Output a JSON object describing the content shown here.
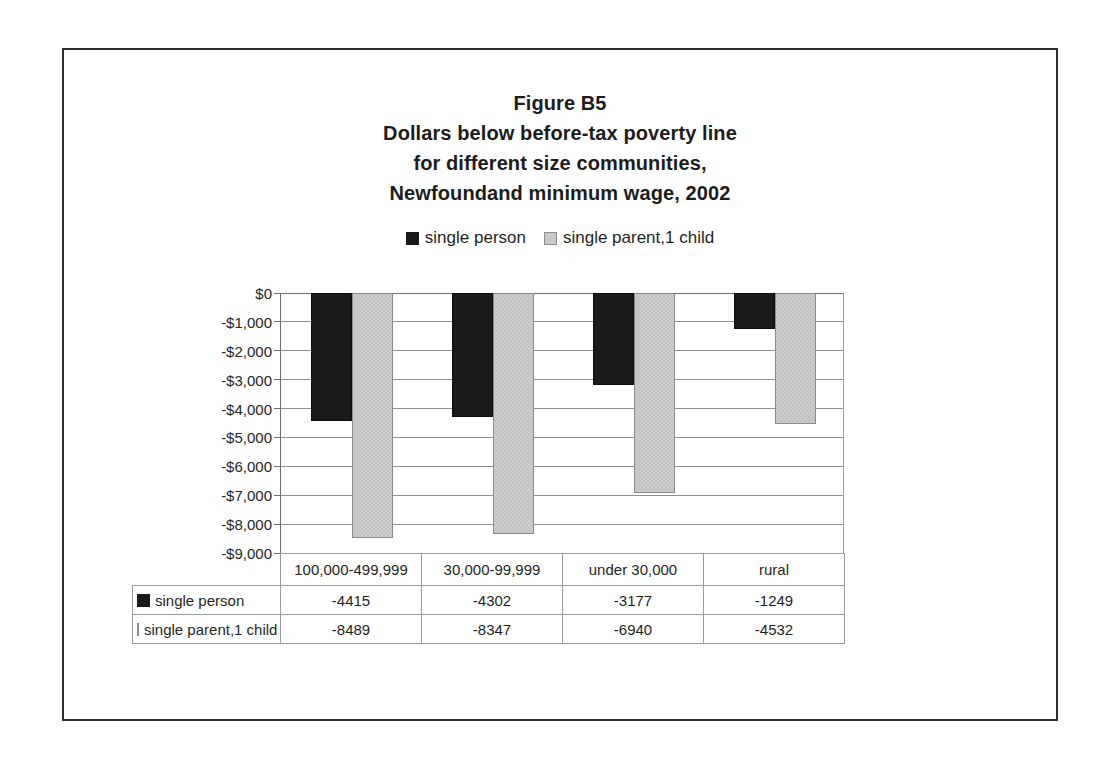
{
  "figure": {
    "title_lines": [
      "Figure B5",
      "Dollars below before-tax poverty line",
      "for different size communities,",
      "Newfoundand minimum wage, 2002"
    ]
  },
  "legend": {
    "entries": [
      {
        "label": "single person",
        "swatch": "dark-square-swatch",
        "color": "#1a1a1a"
      },
      {
        "label": "single parent,1 child",
        "swatch": "light-square-swatch",
        "color": "#c9c9c9"
      }
    ]
  },
  "axis": {
    "y_ticks": [
      "$0",
      "-$1,000",
      "-$2,000",
      "-$3,000",
      "-$4,000",
      "-$5,000",
      "-$6,000",
      "-$7,000",
      "-$8,000",
      "-$9,000"
    ]
  },
  "table": {
    "row_label_header": "",
    "categories": [
      "100,000-499,999",
      "30,000-99,999",
      "under 30,000",
      "rural"
    ],
    "rows": [
      {
        "label": "single person",
        "swatch": "dark-square-swatch",
        "values": [
          "-4415",
          "-4302",
          "-3177",
          "-1249"
        ]
      },
      {
        "label": "single parent,1 child",
        "swatch": "light-square-swatch",
        "values": [
          "-8489",
          "-8347",
          "-6940",
          "-4532"
        ]
      }
    ]
  },
  "chart_data": {
    "type": "bar",
    "xlabel": "",
    "ylabel": "",
    "categories": [
      "100,000-499,999",
      "30,000-99,999",
      "under 30,000",
      "rural"
    ],
    "series": [
      {
        "name": "single person",
        "color": "#1a1a1a",
        "values": [
          -4415,
          -4302,
          -3177,
          -1249
        ]
      },
      {
        "name": "single parent,1 child",
        "color": "#c9c9c9",
        "values": [
          -8489,
          -8347,
          -6940,
          -4532
        ]
      }
    ],
    "ylim": [
      -9000,
      0
    ],
    "ytick_values": [
      0,
      -1000,
      -2000,
      -3000,
      -4000,
      -5000,
      -6000,
      -7000,
      -8000,
      -9000
    ],
    "ytick_labels": [
      "$0",
      "-$1,000",
      "-$2,000",
      "-$3,000",
      "-$4,000",
      "-$5,000",
      "-$6,000",
      "-$7,000",
      "-$8,000",
      "-$9,000"
    ],
    "grid": true,
    "legend_position": "top"
  }
}
